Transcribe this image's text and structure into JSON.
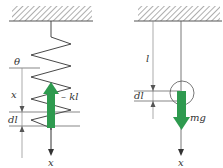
{
  "diagram": {
    "left_panel": {
      "title": "spring",
      "labels": {
        "angle": "θ",
        "displacement": "x",
        "element": "dl",
        "force": "– kl",
        "axis": "x"
      },
      "force_arrow_direction": "up",
      "force_arrow_color": "#2e9a4f"
    },
    "right_panel": {
      "title": "pendulum",
      "labels": {
        "length": "l",
        "element": "dl",
        "force": "mg",
        "axis": "x"
      },
      "force_arrow_direction": "down",
      "force_arrow_color": "#2e9a4f"
    },
    "colors": {
      "line": "#444444",
      "arrow": "#2e9a4f",
      "hatch": "#666666"
    }
  }
}
